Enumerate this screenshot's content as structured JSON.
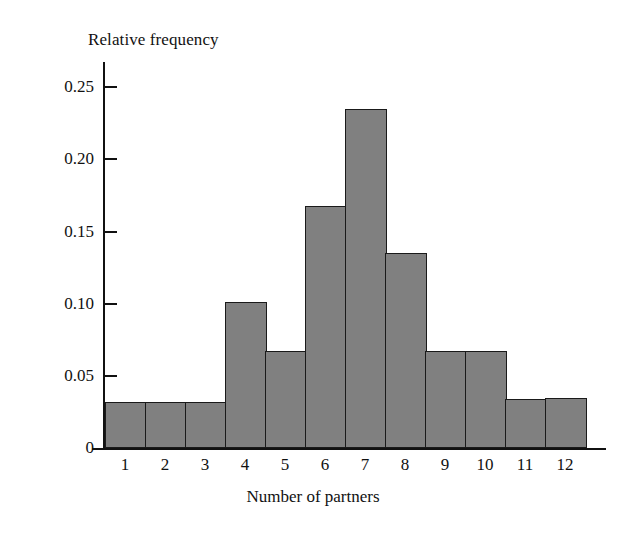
{
  "chart_data": {
    "type": "bar",
    "title": "",
    "subtitle": "",
    "xlabel": "Number of partners",
    "ylabel": "Relative frequency",
    "categories": [
      "1",
      "2",
      "3",
      "4",
      "5",
      "6",
      "7",
      "8",
      "9",
      "10",
      "11",
      "12"
    ],
    "values": [
      0.032,
      0.032,
      0.032,
      0.101,
      0.067,
      0.168,
      0.235,
      0.135,
      0.067,
      0.067,
      0.034,
      0.035
    ],
    "series": [
      {
        "name": "Relative frequency",
        "values": [
          0.032,
          0.032,
          0.032,
          0.101,
          0.067,
          0.168,
          0.235,
          0.135,
          0.067,
          0.067,
          0.034,
          0.035
        ]
      }
    ],
    "ylim": [
      0,
      0.2675
    ],
    "xlim": [
      0.5,
      12.5
    ],
    "ytick_values": [
      0,
      0.05,
      0.1,
      0.15,
      0.2,
      0.25
    ],
    "ytick_labels": [
      "0",
      "0.05",
      "0.10",
      "0.15",
      "0.20",
      "0.25"
    ],
    "xtick_labels": [
      "1",
      "2",
      "3",
      "4",
      "5",
      "6",
      "7",
      "8",
      "9",
      "10",
      "11",
      "12"
    ],
    "grid": false,
    "legend": false,
    "legend_position": "none",
    "bar_fill_color": "#808080",
    "bar_edge_color": "#1a1a1a",
    "axis_color": "#111111",
    "background_color": "#ffffff"
  }
}
